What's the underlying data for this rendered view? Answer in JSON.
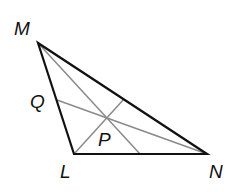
{
  "diagram": {
    "type": "triangle-with-cevians",
    "vertices": {
      "M": {
        "label": "M",
        "x": 38,
        "y": 43
      },
      "L": {
        "label": "L",
        "x": 74,
        "y": 154
      },
      "N": {
        "label": "N",
        "x": 207,
        "y": 154
      }
    },
    "points": {
      "Q": {
        "label": "Q",
        "x": 57,
        "y": 100
      },
      "P": {
        "label": "P",
        "x": 107,
        "y": 117
      }
    },
    "colors": {
      "sides": "#111111",
      "cevians": "#8a8a8a"
    }
  }
}
